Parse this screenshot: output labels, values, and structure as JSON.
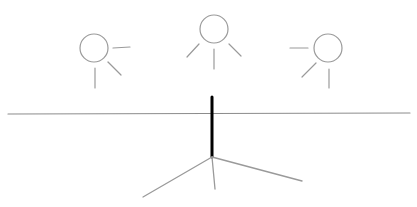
{
  "diagram": {
    "width": 417,
    "height": 207,
    "background": "#ffffff",
    "colors": {
      "light_stroke": "#9a9a9a",
      "ground_stroke": "#8c8c8c",
      "pole_stroke": "#000000"
    },
    "suns": [
      {
        "name": "sun-left",
        "cx": 94,
        "cy": 48,
        "r": 14,
        "rays": [
          {
            "x1": 113,
            "y1": 48,
            "x2": 130,
            "y2": 47
          },
          {
            "x1": 108,
            "y1": 62,
            "x2": 121,
            "y2": 75
          },
          {
            "x1": 95,
            "y1": 68,
            "x2": 95,
            "y2": 88
          }
        ]
      },
      {
        "name": "sun-center",
        "cx": 214,
        "cy": 29,
        "r": 14,
        "rays": [
          {
            "x1": 199,
            "y1": 44,
            "x2": 187,
            "y2": 57
          },
          {
            "x1": 214,
            "y1": 49,
            "x2": 214,
            "y2": 69
          },
          {
            "x1": 229,
            "y1": 44,
            "x2": 241,
            "y2": 56
          }
        ]
      },
      {
        "name": "sun-right",
        "cx": 328,
        "cy": 48,
        "r": 14,
        "rays": [
          {
            "x1": 290,
            "y1": 48,
            "x2": 308,
            "y2": 48
          },
          {
            "x1": 316,
            "y1": 63,
            "x2": 302,
            "y2": 77
          },
          {
            "x1": 329,
            "y1": 69,
            "x2": 329,
            "y2": 88
          }
        ]
      }
    ],
    "ground_line": {
      "x1": 8,
      "y1": 114,
      "x2": 410,
      "y2": 113
    },
    "pole": {
      "x1": 212,
      "y1": 97,
      "x2": 212,
      "y2": 157
    },
    "base_legs": [
      {
        "x1": 212,
        "y1": 157,
        "x2": 143,
        "y2": 197
      },
      {
        "x1": 212,
        "y1": 157,
        "x2": 215,
        "y2": 189
      },
      {
        "x1": 212,
        "y1": 157,
        "x2": 302,
        "y2": 181
      }
    ]
  }
}
